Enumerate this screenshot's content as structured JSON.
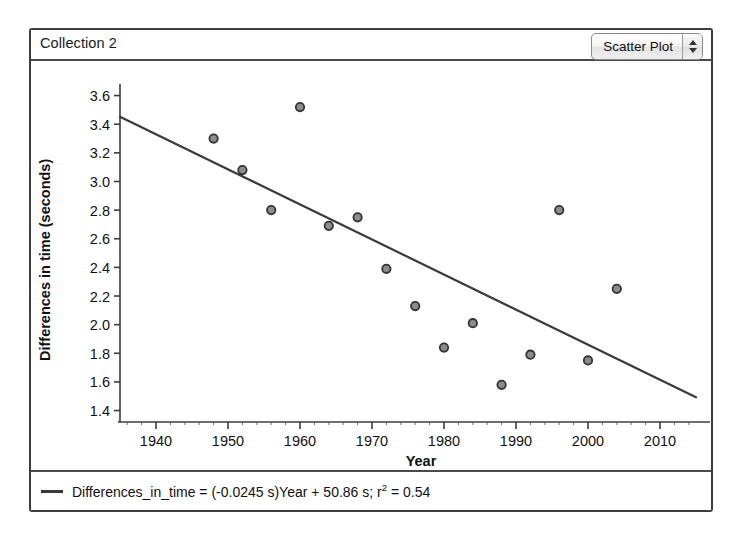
{
  "window": {
    "collection_title": "Collection 2"
  },
  "plot_type_control": {
    "value": "Scatter Plot",
    "up_arrow": "stepper-up-arrow",
    "down_arrow": "stepper-down-arrow"
  },
  "legend": {
    "prefix": "Differences_in_time = (-0.0245 s)Year + 50.86 s; r",
    "exponent": "2",
    "suffix": " = 0.54"
  },
  "chart_data": {
    "type": "scatter",
    "title": "Collection 2",
    "xlabel": "Year",
    "ylabel": "Differences in time (seconds)",
    "xlim": [
      1935,
      2015
    ],
    "ylim": [
      1.32,
      3.66
    ],
    "xticks": [
      1940,
      1950,
      1960,
      1970,
      1980,
      1990,
      2000,
      2010
    ],
    "yticks": [
      1.4,
      1.6,
      1.8,
      2.0,
      2.2,
      2.4,
      2.6,
      2.8,
      3.0,
      3.2,
      3.4,
      3.6
    ],
    "xtick_labels": [
      "1940",
      "1950",
      "1960",
      "1970",
      "1980",
      "1990",
      "2000",
      "2010"
    ],
    "ytick_labels": [
      "1.4",
      "1.6",
      "1.8",
      "2.0",
      "2.2",
      "2.4",
      "2.6",
      "2.8",
      "3.0",
      "3.2",
      "3.4",
      "3.6"
    ],
    "grid": false,
    "legend_position": "bottom",
    "marker_fill": "#8c8c8c",
    "marker_edge": "#333333",
    "line_color": "#3a3a3a",
    "points": [
      {
        "x": 1948,
        "y": 3.3
      },
      {
        "x": 1952,
        "y": 3.08
      },
      {
        "x": 1956,
        "y": 2.8
      },
      {
        "x": 1960,
        "y": 3.52
      },
      {
        "x": 1964,
        "y": 2.69
      },
      {
        "x": 1968,
        "y": 2.75
      },
      {
        "x": 1972,
        "y": 2.39
      },
      {
        "x": 1976,
        "y": 2.13
      },
      {
        "x": 1980,
        "y": 1.84
      },
      {
        "x": 1984,
        "y": 2.01
      },
      {
        "x": 1988,
        "y": 1.58
      },
      {
        "x": 1992,
        "y": 1.79
      },
      {
        "x": 1996,
        "y": 2.8
      },
      {
        "x": 2000,
        "y": 1.75
      },
      {
        "x": 2004,
        "y": 2.25
      }
    ],
    "fit_line": {
      "equation": "Differences_in_time = (-0.0245 s)Year + 50.86 s",
      "slope": -0.0245,
      "intercept": 50.86,
      "r_squared": 0.54,
      "x_start": 1935,
      "x_end": 2015
    }
  }
}
